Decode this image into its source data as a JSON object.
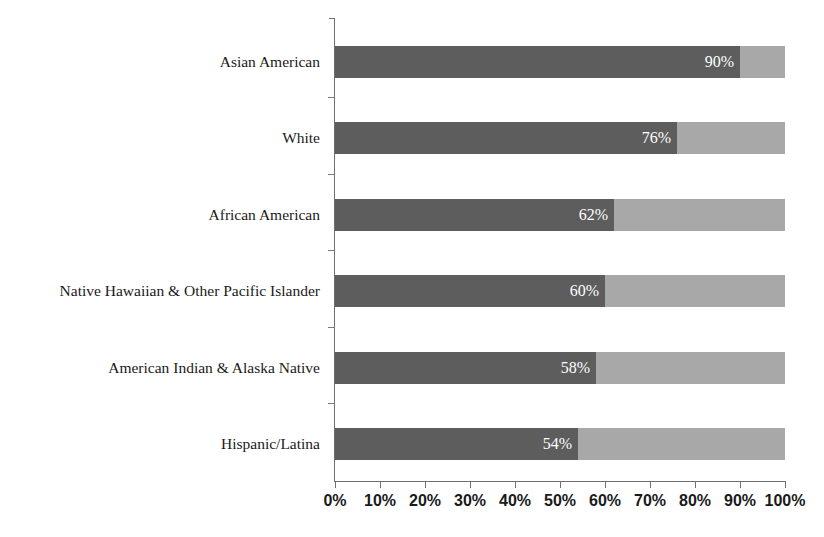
{
  "chart_data": {
    "type": "bar",
    "orientation": "horizontal",
    "stacked": true,
    "title": "",
    "subtitle": "",
    "xlabel": "",
    "ylabel": "",
    "xlim": [
      0,
      100
    ],
    "grid": false,
    "legend": null,
    "categories": [
      "Asian American",
      "White",
      "African American",
      "Native Hawaiian & Other Pacific Islander",
      "American Indian & Alaska Native",
      "Hispanic/Latina"
    ],
    "values": [
      90,
      76,
      62,
      60,
      58,
      54
    ],
    "data_labels": [
      "90%",
      "76%",
      "62%",
      "60%",
      "58%",
      "54%"
    ],
    "remainder_values": [
      10,
      24,
      38,
      40,
      42,
      46
    ],
    "series": [
      {
        "name": "primary",
        "color": "#5d5d5d",
        "values": [
          90,
          76,
          62,
          60,
          58,
          54
        ]
      },
      {
        "name": "remainder",
        "color": "#a8a8a8",
        "values": [
          10,
          24,
          38,
          40,
          42,
          46
        ]
      }
    ],
    "x_tick_labels": [
      "0%",
      "10%",
      "20%",
      "30%",
      "40%",
      "50%",
      "60%",
      "70%",
      "80%",
      "90%",
      "100%"
    ],
    "x_tick_values": [
      0,
      10,
      20,
      30,
      40,
      50,
      60,
      70,
      80,
      90,
      100
    ],
    "colors": {
      "bar_dark": "#5d5d5d",
      "bar_light": "#a8a8a8",
      "axis": "#6f6f6f",
      "text": "#1a1a1a",
      "value_label": "#ffffff",
      "background": "#ffffff"
    }
  }
}
